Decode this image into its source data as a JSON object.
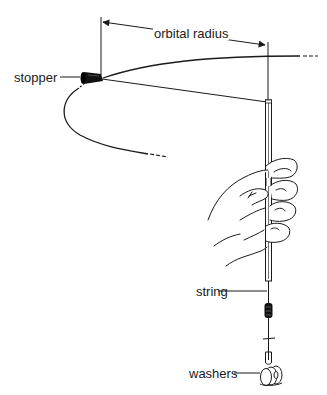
{
  "figure": {
    "type": "physics apparatus diagram",
    "labels": {
      "orbital_radius": "orbital radius",
      "stopper": "stopper",
      "string": "string",
      "washers": "washers"
    },
    "components": [
      {
        "name": "stopper",
        "description": "rubber stopper whirled on the end of the string"
      },
      {
        "name": "orbital-radius-dimension",
        "description": "double-headed arrow from stopper to tube axis"
      },
      {
        "name": "orbit-path",
        "description": "curved path of the stopper, dashed where it recedes"
      },
      {
        "name": "glass-tube",
        "description": "vertical tube held in the hand"
      },
      {
        "name": "hand",
        "description": "hand gripping the tube"
      },
      {
        "name": "string",
        "description": "string running through the tube"
      },
      {
        "name": "marker-clip",
        "description": "marker on the string below the tube"
      },
      {
        "name": "washers",
        "description": "hanging mass of washers on a hook"
      }
    ],
    "colors": {
      "ink": "#1a1a1a",
      "background": "#ffffff"
    }
  }
}
